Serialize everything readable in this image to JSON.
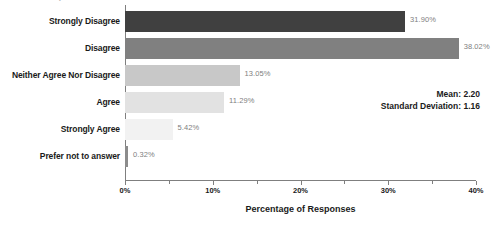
{
  "chart_data": {
    "type": "bar",
    "orientation": "horizontal",
    "title": "",
    "xlabel": "Percentage of Responses",
    "ylabel": "",
    "categories": [
      "Strongly Disagree",
      "Disagree",
      "Neither Agree Nor Disagree",
      "Agree",
      "Strongly Agree",
      "Prefer not to answer"
    ],
    "values": [
      31.9,
      38.02,
      13.05,
      11.29,
      5.42,
      0.32
    ],
    "value_labels": [
      "31.90%",
      "38.02%",
      "13.05%",
      "11.29%",
      "5.42%",
      "0.32%"
    ],
    "bar_colors": [
      "#404040",
      "#808080",
      "#c8c8c8",
      "#e2e2e2",
      "#f2f2f2",
      "#8c8c8c"
    ],
    "xlim": [
      0,
      40
    ],
    "xticks": [
      0,
      10,
      20,
      30,
      40
    ],
    "xtick_labels": [
      "0%",
      "10%",
      "20%",
      "30%",
      "40%"
    ],
    "minor_xticks": [
      5,
      15,
      25,
      35
    ],
    "grid": false,
    "legend": false
  },
  "annotations": {
    "mean_label": "Mean: 2.20",
    "std_label": "Standard Deviation: 1.16"
  },
  "colors": {
    "axis": "#7f7f7f",
    "text": "#1a1a1a",
    "value_text": "#808080"
  }
}
